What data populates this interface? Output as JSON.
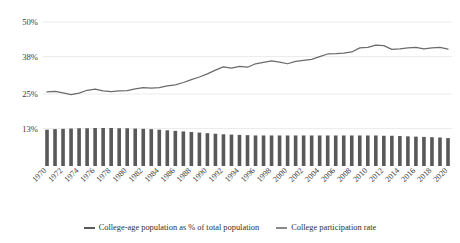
{
  "top_caption": "",
  "legend": {
    "items": [
      {
        "label": "College-age population as % of total population",
        "marker": "bar-swatch",
        "color": "#595959"
      },
      {
        "label": "College participation rate",
        "marker": "line-swatch",
        "color": "#8a8a8a"
      }
    ]
  },
  "axis": {
    "y_ticks": [
      "13%",
      "25%",
      "38%",
      "50%"
    ],
    "x_tick_labels": [
      "1970",
      "1972",
      "1974",
      "1976",
      "1978",
      "1980",
      "1982",
      "1984",
      "1986",
      "1988",
      "1990",
      "1992",
      "1994",
      "1996",
      "1998",
      "2000",
      "2002",
      "2004",
      "2006",
      "2008",
      "2010",
      "2012",
      "2014",
      "2016",
      "2018",
      "2020"
    ]
  },
  "chart_data": {
    "type": "bar",
    "title": "",
    "subtitle": "",
    "xlabel": "",
    "ylabel": "",
    "grid": true,
    "legend_position": "bottom",
    "ylim": [
      0,
      50
    ],
    "y_tick_values": [
      13,
      25,
      38,
      50
    ],
    "x": [
      1970,
      1971,
      1972,
      1973,
      1974,
      1975,
      1976,
      1977,
      1978,
      1979,
      1980,
      1981,
      1982,
      1983,
      1984,
      1985,
      1986,
      1987,
      1988,
      1989,
      1990,
      1991,
      1992,
      1993,
      1994,
      1995,
      1996,
      1997,
      1998,
      1999,
      2000,
      2001,
      2002,
      2003,
      2004,
      2005,
      2006,
      2007,
      2008,
      2009,
      2010,
      2011,
      2012,
      2013,
      2014,
      2015,
      2016,
      2017,
      2018,
      2019,
      2020
    ],
    "series": [
      {
        "name": "College-age population as % of total population",
        "type": "bar",
        "color": "#595959",
        "unit": "%",
        "values": [
          12.6,
          12.8,
          12.9,
          13.0,
          13.1,
          13.1,
          13.2,
          13.2,
          13.2,
          13.1,
          13.1,
          13.0,
          12.9,
          12.8,
          12.6,
          12.4,
          12.2,
          12.0,
          11.8,
          11.6,
          11.4,
          11.2,
          11.0,
          10.9,
          10.8,
          10.7,
          10.6,
          10.6,
          10.6,
          10.6,
          10.6,
          10.6,
          10.6,
          10.6,
          10.6,
          10.6,
          10.6,
          10.6,
          10.6,
          10.6,
          10.6,
          10.6,
          10.5,
          10.5,
          10.4,
          10.3,
          10.2,
          10.1,
          10.0,
          9.9,
          9.7
        ]
      },
      {
        "name": "College participation rate",
        "type": "line",
        "color": "#6b6b6b",
        "unit": "%",
        "values": [
          25.7,
          25.9,
          25.4,
          24.8,
          25.3,
          26.3,
          26.7,
          26.1,
          25.8,
          26.1,
          26.2,
          26.8,
          27.2,
          27.0,
          27.2,
          27.8,
          28.2,
          29.0,
          30.0,
          30.9,
          32.0,
          33.3,
          34.4,
          34.0,
          34.6,
          34.3,
          35.5,
          36.0,
          36.5,
          36.1,
          35.5,
          36.3,
          36.7,
          37.0,
          38.0,
          38.9,
          39.0,
          39.2,
          39.6,
          41.0,
          41.2,
          42.0,
          41.8,
          40.5,
          40.7,
          41.0,
          41.2,
          40.7,
          41.0,
          41.2,
          40.6
        ]
      }
    ]
  }
}
